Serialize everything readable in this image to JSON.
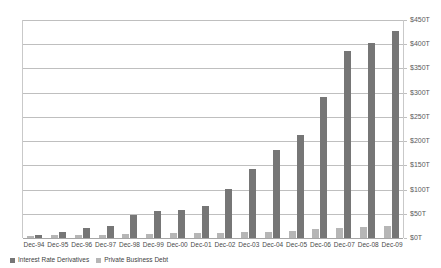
{
  "chart_data": {
    "type": "bar",
    "title": "",
    "subtitle": "",
    "xlabel": "",
    "ylabel": "",
    "ylim": [
      0,
      450
    ],
    "y_ticks": [
      "$0T",
      "$50T",
      "$100T",
      "$150T",
      "$200T",
      "$250T",
      "$300T",
      "$350T",
      "$400T",
      "$450T"
    ],
    "y_tick_values": [
      0,
      50,
      100,
      150,
      200,
      250,
      300,
      350,
      400,
      450
    ],
    "grid": true,
    "legend_position": "bottom-left",
    "y_axis_position": "right",
    "categories": [
      "Dec-94",
      "Dec-95",
      "Dec-96",
      "Dec-97",
      "Dec-98",
      "Dec-99",
      "Dec-00",
      "Dec-01",
      "Dec-02",
      "Dec-03",
      "Dec-04",
      "Dec-05",
      "Dec-06",
      "Dec-07",
      "Dec-08",
      "Dec-09"
    ],
    "series": [
      {
        "name": "Private Business Debt",
        "color": "#b6b6b6",
        "values": [
          5,
          6,
          6,
          7,
          9,
          9,
          10,
          10,
          11,
          12,
          13,
          15,
          18,
          21,
          23,
          24
        ]
      },
      {
        "name": "Interest Rate Derivatives",
        "color": "#767676",
        "values": [
          7,
          13,
          20,
          24,
          48,
          55,
          58,
          66,
          101,
          142,
          181,
          212,
          291,
          386,
          403,
          427
        ]
      }
    ]
  },
  "legend": {
    "items": [
      {
        "label": "Interest Rate Derivatives",
        "color": "#767676"
      },
      {
        "label": "Private Business Debt",
        "color": "#b6b6b6"
      }
    ]
  }
}
